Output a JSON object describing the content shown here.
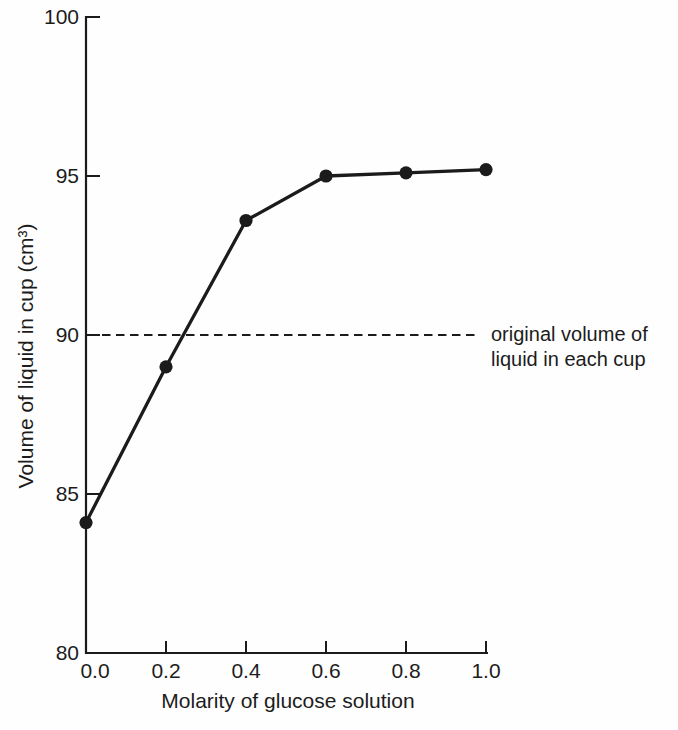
{
  "chart_data": {
    "type": "line",
    "title": "",
    "x": [
      0.0,
      0.2,
      0.4,
      0.6,
      0.8,
      1.0
    ],
    "y": [
      84.1,
      89.0,
      93.6,
      95.0,
      95.1,
      95.2
    ],
    "series": [
      {
        "name": "volume of liquid in cup",
        "values": [
          84.1,
          89.0,
          93.6,
          95.0,
          95.1,
          95.2
        ]
      }
    ],
    "x_axis": {
      "title": "Molarity of glucose solution",
      "tick_labels": [
        "0.0",
        "0.2",
        "0.4",
        "0.6",
        "0.8",
        "1.0"
      ],
      "tick_values": [
        0.0,
        0.2,
        0.4,
        0.6,
        0.8,
        1.0
      ],
      "range": [
        0.0,
        1.0
      ]
    },
    "y_axis": {
      "title": "Volume of liquid in cup (cm³)",
      "tick_labels": [
        "80",
        "85",
        "90",
        "95",
        "100"
      ],
      "tick_values": [
        80,
        85,
        90,
        95,
        100
      ],
      "range": [
        80,
        100
      ]
    },
    "reference_line": {
      "value": 90,
      "style": "dashed",
      "label_lines": [
        "original volume of",
        "liquid in each cup"
      ]
    },
    "grid": false,
    "legend": false,
    "marker": "filled-circle",
    "colors": {
      "ink": "#1b1b1b",
      "text": "#1c1c1c",
      "paper": "#fefefe"
    }
  }
}
